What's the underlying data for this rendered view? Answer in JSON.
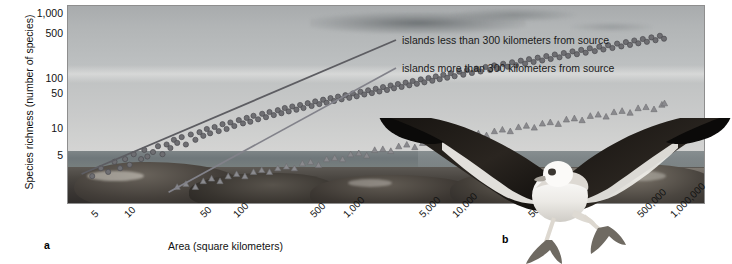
{
  "figure": {
    "panel_a_id": "a",
    "panel_b_id": "b"
  },
  "axes": {
    "y_title": "Species richness (number of species)",
    "x_title": "Area (square kilometers)"
  },
  "legend": {
    "entries": [
      {
        "label": "islands less than 300 kilometers from source",
        "marker": "circle",
        "color": "#6e6e72"
      },
      {
        "label": "islands more than 300 kilometers from source",
        "marker": "triangle",
        "color": "#8a8a8e"
      }
    ]
  },
  "photo": {
    "alt_name": "coastal-rocky-shoreline-with-sea-and-sky"
  },
  "bird": {
    "alt_name": "albatross-in-flight"
  },
  "chart_data": {
    "type": "scatter",
    "title": "",
    "xlabel": "Area (square kilometers)",
    "ylabel": "Species richness (number of species)",
    "xscale": "log",
    "yscale": "log",
    "xlim": [
      3,
      2000000
    ],
    "ylim": [
      3,
      1500
    ],
    "grid": false,
    "legend_position": "upper-right-inside",
    "xticks": [
      "5",
      "10",
      "50",
      "100",
      "500",
      "1,000",
      "5,000",
      "10,000",
      "50,000",
      "100,000",
      "500,000",
      "1,000,000"
    ],
    "xtick_values": [
      5,
      10,
      50,
      100,
      500,
      1000,
      5000,
      10000,
      50000,
      100000,
      500000,
      1000000
    ],
    "yticks": [
      "5",
      "10",
      "50",
      "100",
      "500",
      "1,000"
    ],
    "ytick_values": [
      5,
      10,
      50,
      100,
      500,
      1000
    ],
    "series": [
      {
        "name": "islands less than 300 kilometers from source",
        "marker": "circle",
        "color": "#6e6e72",
        "trendline": {
          "x": [
            4,
            900000
          ],
          "y": [
            7.5,
            420
          ]
        },
        "points": [
          [
            5,
            7
          ],
          [
            6,
            9
          ],
          [
            7,
            8
          ],
          [
            8,
            11
          ],
          [
            9,
            9
          ],
          [
            10,
            12
          ],
          [
            11,
            10
          ],
          [
            12,
            14
          ],
          [
            14,
            12
          ],
          [
            15,
            16
          ],
          [
            16,
            13
          ],
          [
            18,
            15
          ],
          [
            20,
            18
          ],
          [
            22,
            14
          ],
          [
            24,
            19
          ],
          [
            26,
            17
          ],
          [
            28,
            22
          ],
          [
            30,
            20
          ],
          [
            33,
            24
          ],
          [
            36,
            19
          ],
          [
            40,
            26
          ],
          [
            44,
            22
          ],
          [
            48,
            28
          ],
          [
            52,
            25
          ],
          [
            56,
            31
          ],
          [
            60,
            27
          ],
          [
            66,
            33
          ],
          [
            72,
            29
          ],
          [
            78,
            36
          ],
          [
            85,
            31
          ],
          [
            92,
            38
          ],
          [
            100,
            34
          ],
          [
            110,
            41
          ],
          [
            120,
            37
          ],
          [
            130,
            44
          ],
          [
            140,
            39
          ],
          [
            150,
            47
          ],
          [
            165,
            42
          ],
          [
            180,
            50
          ],
          [
            195,
            45
          ],
          [
            210,
            53
          ],
          [
            230,
            48
          ],
          [
            250,
            56
          ],
          [
            270,
            51
          ],
          [
            290,
            60
          ],
          [
            315,
            54
          ],
          [
            340,
            63
          ],
          [
            370,
            57
          ],
          [
            400,
            66
          ],
          [
            430,
            60
          ],
          [
            470,
            70
          ],
          [
            510,
            64
          ],
          [
            550,
            74
          ],
          [
            600,
            68
          ],
          [
            650,
            78
          ],
          [
            700,
            71
          ],
          [
            760,
            82
          ],
          [
            820,
            75
          ],
          [
            890,
            86
          ],
          [
            960,
            79
          ],
          [
            1040,
            90
          ],
          [
            1130,
            83
          ],
          [
            1220,
            95
          ],
          [
            1320,
            87
          ],
          [
            1430,
            100
          ],
          [
            1550,
            92
          ],
          [
            1680,
            105
          ],
          [
            1820,
            96
          ],
          [
            1970,
            110
          ],
          [
            2130,
            101
          ],
          [
            2300,
            116
          ],
          [
            2500,
            106
          ],
          [
            2700,
            122
          ],
          [
            2900,
            112
          ],
          [
            3150,
            128
          ],
          [
            3400,
            117
          ],
          [
            3700,
            134
          ],
          [
            4000,
            123
          ],
          [
            4300,
            141
          ],
          [
            4700,
            129
          ],
          [
            5100,
            148
          ],
          [
            5500,
            135
          ],
          [
            6000,
            155
          ],
          [
            6500,
            142
          ],
          [
            7000,
            163
          ],
          [
            7600,
            149
          ],
          [
            8200,
            171
          ],
          [
            8900,
            156
          ],
          [
            9600,
            180
          ],
          [
            10400,
            164
          ],
          [
            11500,
            189
          ],
          [
            12500,
            172
          ],
          [
            13500,
            198
          ],
          [
            15000,
            181
          ],
          [
            16500,
            208
          ],
          [
            18000,
            190
          ],
          [
            20000,
            219
          ],
          [
            22000,
            200
          ],
          [
            24000,
            230
          ],
          [
            26000,
            210
          ],
          [
            29000,
            242
          ],
          [
            32000,
            221
          ],
          [
            35000,
            254
          ],
          [
            38000,
            232
          ],
          [
            42000,
            267
          ],
          [
            46000,
            244
          ],
          [
            50000,
            280
          ],
          [
            55000,
            256
          ],
          [
            60000,
            294
          ],
          [
            66000,
            269
          ],
          [
            72000,
            309
          ],
          [
            79000,
            282
          ],
          [
            86000,
            325
          ],
          [
            95000,
            297
          ],
          [
            104000,
            341
          ],
          [
            114000,
            312
          ],
          [
            125000,
            358
          ],
          [
            137000,
            328
          ],
          [
            150000,
            376
          ],
          [
            165000,
            344
          ],
          [
            180000,
            395
          ],
          [
            200000,
            362
          ],
          [
            220000,
            415
          ],
          [
            240000,
            380
          ],
          [
            265000,
            436
          ],
          [
            290000,
            399
          ],
          [
            320000,
            458
          ],
          [
            350000,
            419
          ],
          [
            385000,
            481
          ],
          [
            420000,
            440
          ],
          [
            460000,
            505
          ],
          [
            500000,
            462
          ],
          [
            550000,
            530
          ],
          [
            600000,
            485
          ],
          [
            660000,
            557
          ],
          [
            720000,
            510
          ],
          [
            790000,
            585
          ],
          [
            860000,
            535
          ]
        ]
      },
      {
        "name": "islands more than 300 kilometers from source",
        "marker": "triangle",
        "color": "#8a8a8e",
        "trendline": {
          "x": [
            25,
            900000
          ],
          "y": [
            4.2,
            175
          ]
        },
        "points": [
          [
            30,
            5
          ],
          [
            36,
            5.5
          ],
          [
            44,
            5
          ],
          [
            52,
            6
          ],
          [
            62,
            6.5
          ],
          [
            74,
            6
          ],
          [
            88,
            7
          ],
          [
            105,
            7.5
          ],
          [
            125,
            7
          ],
          [
            150,
            8
          ],
          [
            178,
            8.5
          ],
          [
            210,
            8
          ],
          [
            250,
            9
          ],
          [
            300,
            9.5
          ],
          [
            355,
            9
          ],
          [
            420,
            10.5
          ],
          [
            500,
            11
          ],
          [
            590,
            10
          ],
          [
            700,
            12
          ],
          [
            830,
            12.5
          ],
          [
            980,
            12
          ],
          [
            1160,
            14
          ],
          [
            1380,
            14.5
          ],
          [
            1630,
            13.5
          ],
          [
            1930,
            16
          ],
          [
            2290,
            16.5
          ],
          [
            2710,
            15.5
          ],
          [
            3200,
            18
          ],
          [
            3800,
            19
          ],
          [
            4500,
            17.5
          ],
          [
            5300,
            20
          ],
          [
            6300,
            21
          ],
          [
            7450,
            20
          ],
          [
            8800,
            23
          ],
          [
            10400,
            24
          ],
          [
            12300,
            22.5
          ],
          [
            14600,
            26
          ],
          [
            17200,
            27
          ],
          [
            20400,
            25.5
          ],
          [
            24100,
            29
          ],
          [
            28500,
            30.5
          ],
          [
            33700,
            29
          ],
          [
            40000,
            33
          ],
          [
            47300,
            34.5
          ],
          [
            55900,
            32.5
          ],
          [
            66200,
            37
          ],
          [
            78300,
            38.5
          ],
          [
            92600,
            36.5
          ],
          [
            110000,
            42
          ],
          [
            130000,
            43.5
          ],
          [
            153000,
            41
          ],
          [
            182000,
            47
          ],
          [
            215000,
            49
          ],
          [
            254000,
            46
          ],
          [
            300000,
            53
          ],
          [
            356000,
            55
          ],
          [
            421000,
            52
          ],
          [
            498000,
            60
          ],
          [
            589000,
            62
          ],
          [
            697000,
            58
          ],
          [
            824000,
            67
          ],
          [
            870000,
            70
          ]
        ]
      }
    ]
  }
}
